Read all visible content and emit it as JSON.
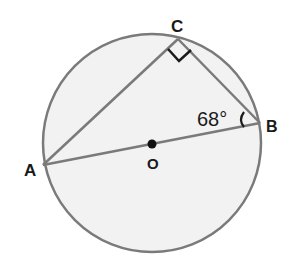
{
  "diagram": {
    "colors": {
      "circle_fill": "#f2f2f2",
      "stroke": "#7a7a7a",
      "text": "#1a1a1a",
      "right_angle_mark": "#1a1a1a"
    },
    "circle": {
      "center_label": "O",
      "cx": 152,
      "cy": 143,
      "r": 109
    },
    "points": {
      "A": {
        "label": "A",
        "x": 43,
        "y": 165
      },
      "B": {
        "label": "B",
        "x": 260,
        "y": 123
      },
      "C": {
        "label": "C",
        "x": 178,
        "y": 39
      },
      "O": {
        "label": "O",
        "x": 152,
        "y": 144
      }
    },
    "segments": [
      "AB",
      "AC",
      "CB"
    ],
    "angles": {
      "B": {
        "value": "68°"
      },
      "C": {
        "type": "right-angle"
      }
    }
  }
}
